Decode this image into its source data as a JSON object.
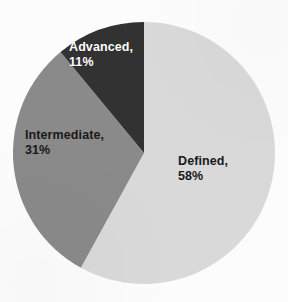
{
  "figure": {
    "name": "maturity-level-distribution-pie",
    "background_color": "#fcfcfc",
    "width": 288,
    "height": 302
  },
  "chart_data": {
    "type": "pie",
    "title": "",
    "subtitle": "",
    "xlabel": "",
    "ylabel": "",
    "legend_position": "none",
    "grid": false,
    "labels_inside_slices": true,
    "start_angle_deg": 90,
    "direction": "counterclockwise",
    "categories": [
      "Defined",
      "Intermediate",
      "Advanced"
    ],
    "values": [
      58,
      31,
      11
    ],
    "value_unit": "%",
    "total": 100,
    "colors": [
      "#d9d9d9",
      "#8a8a8a",
      "#333333"
    ],
    "slices": [
      {
        "label": "Defined",
        "value": 58,
        "value_text": "58%",
        "label_text": "Defined,",
        "color": "#d9d9d9",
        "text_color": "#1a1a1a"
      },
      {
        "label": "Intermediate",
        "value": 31,
        "value_text": "31%",
        "label_text": "Intermediate,",
        "color": "#8a8a8a",
        "text_color": "#1a1a1a"
      },
      {
        "label": "Advanced",
        "value": 11,
        "value_text": "11%",
        "label_text": "Advanced,",
        "color": "#333333",
        "text_color": "#ffffff"
      }
    ]
  },
  "colors": {
    "slice_defined": "#d9d9d9",
    "slice_intermediate": "#8a8a8a",
    "slice_advanced": "#333333",
    "background": "#fcfcfc",
    "label_dark": "#1a1a1a",
    "label_light": "#ffffff"
  }
}
